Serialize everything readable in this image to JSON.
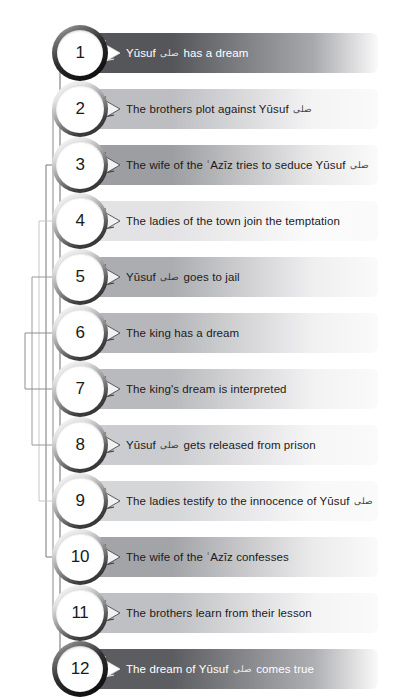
{
  "diagram": {
    "honorific_glyph": "صلى",
    "bar_left": 84,
    "bar_width": 294,
    "row_height": 56,
    "first_row_top": 25,
    "colors": {
      "bar_darkest": "#55565a",
      "bar_lightest": "#ededee",
      "bar_fade": "#fafafa",
      "text_dark": "#1b1b1b",
      "text_light": "#ffffff",
      "bracket_line": "#8d8d8d",
      "badge_ring_dark": "#141414",
      "page_background": "#ffffff"
    },
    "rows": [
      {
        "number": "1",
        "text_before": "Yūsuf",
        "has_honorific": true,
        "text_after": "has a dream",
        "full_text": "Yūsuf صلى has a dream",
        "start_color": "#55565a",
        "end_color": "#a8a9ad",
        "dark": true,
        "emphasis": "strong",
        "pair_with": "12"
      },
      {
        "number": "2",
        "text_before": "The brothers plot against Yūsuf",
        "has_honorific": true,
        "text_after": "",
        "full_text": "The brothers plot against Yūsuf صلى",
        "start_color": "#bdbec2",
        "end_color": "#f4f4f5",
        "dark": false,
        "emphasis": "normal",
        "pair_with": "11"
      },
      {
        "number": "3",
        "text_before": "The wife of the ʿAzīz tries to seduce Yūsuf",
        "has_honorific": true,
        "text_after": "",
        "full_text": "The wife of the ʿAzīz tries to seduce Yūsuf صلى",
        "start_color": "#9d9ea2",
        "end_color": "#e9e9ea",
        "dark": false,
        "emphasis": "normal",
        "pair_with": "10"
      },
      {
        "number": "4",
        "text_before": "The ladies of the town join the temptation",
        "has_honorific": false,
        "text_after": "",
        "full_text": "The ladies of the town join the temptation",
        "start_color": "#e3e3e5",
        "end_color": "#fbfbfb",
        "dark": false,
        "emphasis": "normal",
        "pair_with": "9"
      },
      {
        "number": "5",
        "text_before": "Yūsuf",
        "has_honorific": true,
        "text_after": "goes to jail",
        "full_text": "Yūsuf صلى goes to jail",
        "start_color": "#acadb1",
        "end_color": "#efeff0",
        "dark": false,
        "emphasis": "normal",
        "pair_with": "8"
      },
      {
        "number": "6",
        "text_before": "The king has a dream",
        "has_honorific": false,
        "text_after": "",
        "full_text": "The king has a dream",
        "start_color": "#b6b7ba",
        "end_color": "#f1f1f2",
        "dark": false,
        "emphasis": "normal",
        "pair_with": "7"
      },
      {
        "number": "7",
        "text_before": "The king's dream is interpreted",
        "has_honorific": false,
        "text_after": "",
        "full_text": "The king's dream is interpreted",
        "start_color": "#b9babd",
        "end_color": "#f2f2f3",
        "dark": false,
        "emphasis": "normal",
        "pair_with": "6"
      },
      {
        "number": "8",
        "text_before": "Yūsuf",
        "has_honorific": true,
        "text_after": "gets released from prison",
        "full_text": "Yūsuf صلى gets released from prison",
        "start_color": "#cbcccf",
        "end_color": "#f6f6f7",
        "dark": false,
        "emphasis": "normal",
        "pair_with": "5"
      },
      {
        "number": "9",
        "text_before": "The ladies testify to the innocence of Yūsuf",
        "has_honorific": true,
        "text_after": "",
        "full_text": "The ladies testify to the innocence of Yūsuf صلى",
        "start_color": "#d5d6d8",
        "end_color": "#f8f8f9",
        "dark": false,
        "emphasis": "normal",
        "pair_with": "4"
      },
      {
        "number": "10",
        "text_before": "The wife of the ʿAzīz confesses",
        "has_honorific": false,
        "text_after": "",
        "full_text": "The wife of the ʿAzīz confesses",
        "start_color": "#a3a4a8",
        "end_color": "#ebebec",
        "dark": false,
        "emphasis": "normal",
        "pair_with": "3"
      },
      {
        "number": "11",
        "text_before": "The brothers learn from their lesson",
        "has_honorific": false,
        "text_after": "",
        "full_text": "The brothers learn from their lesson",
        "start_color": "#bfc0c3",
        "end_color": "#f4f4f5",
        "dark": false,
        "emphasis": "normal",
        "pair_with": "2"
      },
      {
        "number": "12",
        "text_before": "The dream of Yūsuf",
        "has_honorific": true,
        "text_after": "comes true",
        "full_text": "The dream of Yūsuf صلى comes true",
        "start_color": "#5c5d61",
        "end_color": "#aeafb3",
        "dark": true,
        "emphasis": "strong",
        "pair_with": "1"
      }
    ],
    "brackets": [
      {
        "pair": "1-12",
        "x": 60,
        "from_row": 1,
        "to_row": 12,
        "shade": "#6d6d6d"
      },
      {
        "pair": "2-11",
        "x": 53,
        "from_row": 2,
        "to_row": 11,
        "shade": "#8a8a8a"
      },
      {
        "pair": "3-10",
        "x": 46,
        "from_row": 3,
        "to_row": 10,
        "shade": "#787878"
      },
      {
        "pair": "4-9",
        "x": 39,
        "from_row": 4,
        "to_row": 9,
        "shade": "#c8c8c8"
      },
      {
        "pair": "5-8",
        "x": 32,
        "from_row": 5,
        "to_row": 8,
        "shade": "#9a9a9a"
      },
      {
        "pair": "6-7",
        "x": 25,
        "from_row": 6,
        "to_row": 7,
        "shade": "#8f8f8f"
      }
    ]
  }
}
